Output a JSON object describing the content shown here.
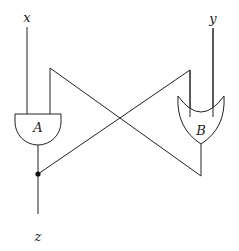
{
  "diagram": {
    "title": "",
    "inputs": [
      {
        "id": "x",
        "label": "x"
      },
      {
        "id": "y",
        "label": "y"
      }
    ],
    "outputs": [
      {
        "id": "z",
        "label": "z"
      }
    ],
    "gates": [
      {
        "id": "A",
        "label": "A",
        "type": "AND"
      },
      {
        "id": "B",
        "label": "B",
        "type": "OR"
      }
    ],
    "connections": [
      {
        "from": "x",
        "to": "A.input1"
      },
      {
        "from": "y",
        "to": "B.input2"
      },
      {
        "from": "A.output",
        "to": "z"
      },
      {
        "from": "A.output",
        "to": "B.input1",
        "note": "feedback via junction dot"
      },
      {
        "from": "B.output",
        "to": "A.input2",
        "note": "crossing feedback wire"
      }
    ],
    "colors": {
      "line": "#222222",
      "background": "#ffffff"
    }
  }
}
